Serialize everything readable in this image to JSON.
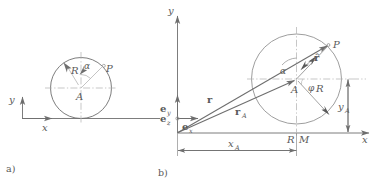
{
  "figure": {
    "caption_a": "a)",
    "caption_b": "b)",
    "stroke_dark": "#6e6e6e",
    "stroke_light": "#b5b5b5",
    "stroke_dash": "#b9b9b9"
  },
  "panel_a": {
    "id": "a)",
    "axis_x_label": "x",
    "axis_y_label": "y",
    "radius_label": "R",
    "angle_label": "α",
    "point_label": "P",
    "center_label": "A",
    "description": "Circle rolling on a horizontal line with center A, radius R, angle alpha to point P"
  },
  "panel_b": {
    "id": "b)",
    "axis_x_label": "x",
    "axis_y_label": "y",
    "basis_y_label": "e",
    "basis_y_sub": "y",
    "basis_z_label": "e",
    "basis_z_sub": "z",
    "basis_x_label": "e",
    "basis_x_sub": "x",
    "vector_r_label": "r",
    "vector_rA_label": "r",
    "vector_rA_sub": "A",
    "vector_rhat_label": "r̂",
    "angle_alpha_label": "α",
    "angle_phi_label": "φ",
    "point_P_label": "P",
    "point_A_label": "A",
    "point_M_label": "M",
    "arc_R_label": "R",
    "radius_R_label": "R",
    "dim_xA_label": "x",
    "dim_xA_sub": "A",
    "dim_yA_label": "y",
    "dim_yA_sub": "A",
    "description": "Position vectors r, r_A and relative vector r-hat to point P on a circle of radius R centered at A"
  }
}
